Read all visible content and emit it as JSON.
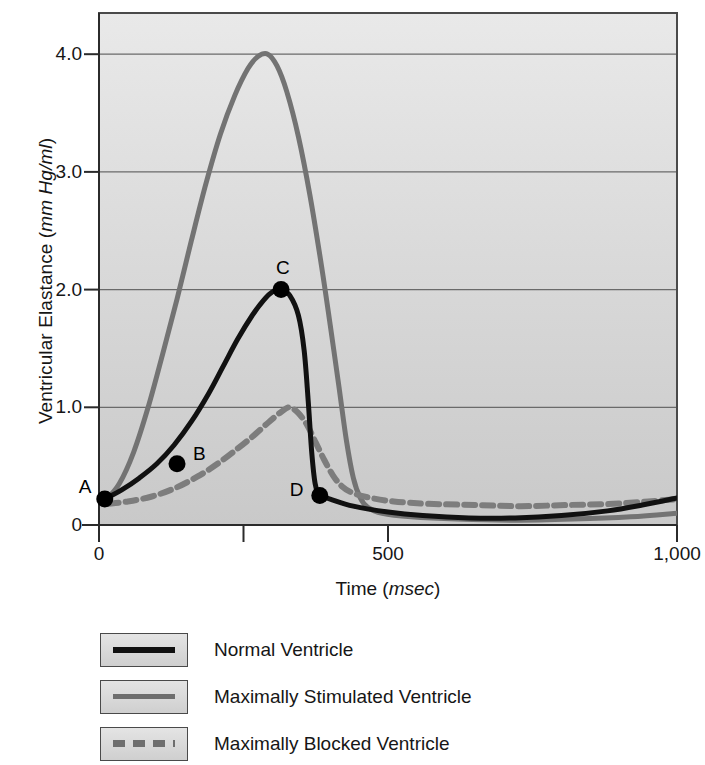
{
  "chart_data": {
    "type": "line",
    "title": "",
    "xlabel": "Time (msec)",
    "xlabel_main": "Time (",
    "xlabel_unit": "msec",
    "xlabel_tail": ")",
    "ylabel": "Ventricular Elastance (mm Hg/ml)",
    "ylabel_main": "Ventricular Elastance (",
    "ylabel_unit": "mm Hg/ml",
    "ylabel_tail": ")",
    "xlim": [
      0,
      1000
    ],
    "ylim": [
      0,
      4.35
    ],
    "grid": true,
    "grid_axis": "y",
    "legend_position": "below",
    "x_ticks": [
      0,
      250,
      500,
      750,
      1000
    ],
    "x_tick_labels": [
      "0",
      "",
      "500",
      "",
      "1,000"
    ],
    "y_ticks": [
      0,
      1.0,
      2.0,
      3.0,
      4.0
    ],
    "y_tick_labels": [
      "0",
      "1.0",
      "2.0",
      "3.0",
      "4.0"
    ],
    "series": [
      {
        "name": "Normal Ventricle",
        "color": "#111111",
        "style": "solid",
        "width": 5,
        "points": [
          [
            10,
            0.22
          ],
          [
            40,
            0.3
          ],
          [
            70,
            0.4
          ],
          [
            100,
            0.52
          ],
          [
            130,
            0.68
          ],
          [
            160,
            0.88
          ],
          [
            190,
            1.12
          ],
          [
            215,
            1.35
          ],
          [
            240,
            1.58
          ],
          [
            265,
            1.78
          ],
          [
            285,
            1.91
          ],
          [
            300,
            1.98
          ],
          [
            315,
            2.0
          ],
          [
            330,
            1.95
          ],
          [
            345,
            1.78
          ],
          [
            355,
            1.48
          ],
          [
            362,
            1.05
          ],
          [
            368,
            0.62
          ],
          [
            374,
            0.35
          ],
          [
            382,
            0.25
          ],
          [
            400,
            0.22
          ],
          [
            440,
            0.16
          ],
          [
            500,
            0.11
          ],
          [
            560,
            0.08
          ],
          [
            640,
            0.06
          ],
          [
            720,
            0.06
          ],
          [
            800,
            0.08
          ],
          [
            880,
            0.12
          ],
          [
            940,
            0.17
          ],
          [
            1000,
            0.23
          ]
        ]
      },
      {
        "name": "Maximally Stimulated Ventricle",
        "color": "#737373",
        "style": "solid",
        "width": 5,
        "points": [
          [
            10,
            0.2
          ],
          [
            35,
            0.35
          ],
          [
            60,
            0.62
          ],
          [
            85,
            1.0
          ],
          [
            110,
            1.45
          ],
          [
            135,
            1.92
          ],
          [
            160,
            2.42
          ],
          [
            185,
            2.9
          ],
          [
            210,
            3.32
          ],
          [
            235,
            3.65
          ],
          [
            258,
            3.88
          ],
          [
            275,
            3.98
          ],
          [
            292,
            4.0
          ],
          [
            308,
            3.9
          ],
          [
            325,
            3.68
          ],
          [
            345,
            3.3
          ],
          [
            365,
            2.8
          ],
          [
            385,
            2.2
          ],
          [
            400,
            1.7
          ],
          [
            415,
            1.18
          ],
          [
            428,
            0.72
          ],
          [
            440,
            0.4
          ],
          [
            452,
            0.23
          ],
          [
            465,
            0.15
          ],
          [
            490,
            0.1
          ],
          [
            540,
            0.07
          ],
          [
            620,
            0.05
          ],
          [
            720,
            0.04
          ],
          [
            820,
            0.05
          ],
          [
            920,
            0.07
          ],
          [
            1000,
            0.1
          ]
        ]
      },
      {
        "name": "Maximally Blocked Ventricle",
        "color": "#7d7d7d",
        "style": "dashed",
        "width": 6,
        "points": [
          [
            15,
            0.18
          ],
          [
            50,
            0.2
          ],
          [
            90,
            0.24
          ],
          [
            130,
            0.31
          ],
          [
            170,
            0.41
          ],
          [
            205,
            0.52
          ],
          [
            240,
            0.65
          ],
          [
            270,
            0.77
          ],
          [
            295,
            0.88
          ],
          [
            315,
            0.96
          ],
          [
            330,
            1.0
          ],
          [
            345,
            0.95
          ],
          [
            360,
            0.85
          ],
          [
            375,
            0.7
          ],
          [
            390,
            0.55
          ],
          [
            405,
            0.42
          ],
          [
            420,
            0.33
          ],
          [
            440,
            0.27
          ],
          [
            470,
            0.23
          ],
          [
            510,
            0.2
          ],
          [
            570,
            0.18
          ],
          [
            650,
            0.17
          ],
          [
            730,
            0.16
          ],
          [
            810,
            0.17
          ],
          [
            890,
            0.18
          ],
          [
            950,
            0.2
          ],
          [
            1000,
            0.22
          ]
        ]
      }
    ],
    "annotations": [
      {
        "label": "A",
        "x": 10,
        "y": 0.22,
        "label_dx": -26,
        "label_dy": -22,
        "marker": true
      },
      {
        "label": "B",
        "x": 135,
        "y": 0.52,
        "label_dx": 16,
        "label_dy": -20,
        "marker": true
      },
      {
        "label": "C",
        "x": 315,
        "y": 2.0,
        "label_dx": -5,
        "label_dy": -32,
        "marker": true
      },
      {
        "label": "D",
        "x": 382,
        "y": 0.25,
        "label_dx": -30,
        "label_dy": -16,
        "marker": true
      }
    ],
    "marker_color": "#000000",
    "marker_radius": 8.5,
    "plot_background": [
      "#e9e9e9",
      "#c9c9c9"
    ],
    "frame_color": "#4a4a4a",
    "gridline_color": "#6a6a6a"
  },
  "legend": {
    "items": [
      {
        "label": "Normal Ventricle",
        "color": "#111111",
        "style": "solid",
        "thickness": 6
      },
      {
        "label": "Maximally Stimulated Ventricle",
        "color": "#6e6e6e",
        "style": "solid",
        "thickness": 5
      },
      {
        "label": "Maximally Blocked Ventricle",
        "color": "#6e6e6e",
        "style": "dashed",
        "thickness": 7
      }
    ]
  }
}
